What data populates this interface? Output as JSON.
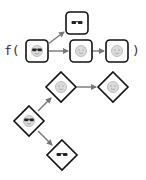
{
  "colors": {
    "stroke": "#111111",
    "arrow": "#777777",
    "face": "#d9d9d9",
    "face_outline": "#aaaaaa",
    "glasses": "#222222",
    "text": "#333333"
  },
  "call_expression": {
    "open": "f(",
    "close": ")"
  },
  "boxes": [
    {
      "id": "input",
      "icon": "smiley-with-sunglasses-icon"
    },
    {
      "id": "glasses-out",
      "icon": "sunglasses-icon"
    },
    {
      "id": "smiley-1",
      "icon": "plain-smiley-icon"
    },
    {
      "id": "smiley-2",
      "icon": "plain-smiley-icon"
    }
  ],
  "diamonds": [
    {
      "id": "root",
      "icon": "smiley-with-sunglasses-icon"
    },
    {
      "id": "branch-smiley-1",
      "icon": "plain-smiley-icon"
    },
    {
      "id": "branch-smiley-2",
      "icon": "plain-smiley-icon"
    },
    {
      "id": "branch-glasses",
      "icon": "sunglasses-icon"
    }
  ]
}
